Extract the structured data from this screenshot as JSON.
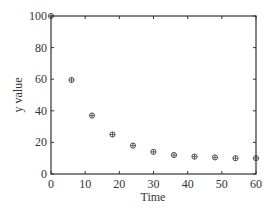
{
  "chart_data": {
    "type": "scatter",
    "title": "",
    "xlabel": "Time",
    "ylabel": "y value",
    "xlim": [
      0,
      60
    ],
    "ylim": [
      0,
      100
    ],
    "xticks": [
      0,
      10,
      20,
      30,
      40,
      50,
      60
    ],
    "yticks": [
      0,
      20,
      40,
      60,
      80,
      100
    ],
    "grid": false,
    "legend": null,
    "series": [
      {
        "name": "data",
        "marker": "circle-plus",
        "x": [
          0,
          6,
          12,
          18,
          24,
          30,
          36,
          42,
          48,
          54,
          60
        ],
        "y": [
          100,
          59.5,
          37,
          25,
          18,
          14,
          12,
          11,
          10.5,
          10,
          10
        ]
      }
    ]
  },
  "colors": {
    "axis": "#333333",
    "marker": "#444444",
    "background": "#ffffff"
  }
}
